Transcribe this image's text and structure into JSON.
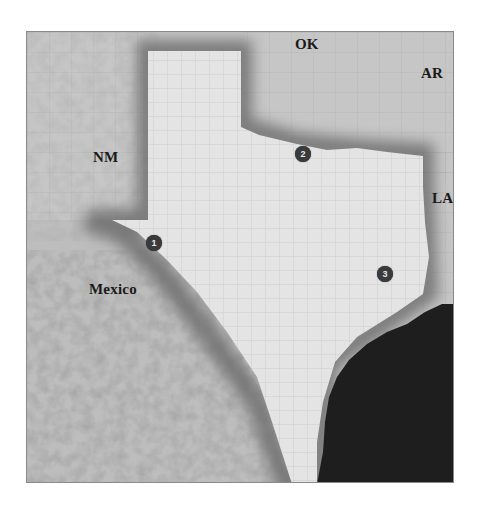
{
  "map": {
    "title": "Texas relief map with county boundaries",
    "labels": {
      "nm": "NM",
      "ok": "OK",
      "ar": "AR",
      "la": "LA",
      "mexico": "Mexico"
    },
    "markers": [
      {
        "number": "1",
        "x": 153,
        "y": 242
      },
      {
        "number": "2",
        "x": 302,
        "y": 153
      },
      {
        "number": "3",
        "x": 384,
        "y": 273
      }
    ],
    "colors": {
      "texas_land": "#e2e2e2",
      "neighbor_land": "#c4c4c4",
      "border_shadow": "#7a7a7a",
      "gulf_water": "#1e1e1e",
      "marker_fill": "#3a3a3a",
      "label_text": "#1a1a1a"
    }
  }
}
